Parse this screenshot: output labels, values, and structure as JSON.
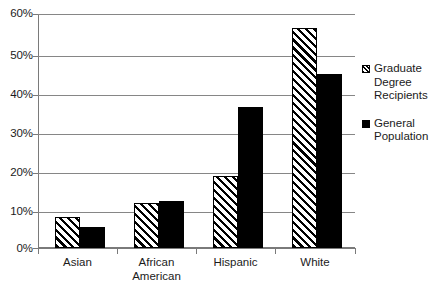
{
  "chart_data": {
    "type": "bar",
    "title": "",
    "subtitle": "",
    "xlabel": "",
    "ylabel": "",
    "categories": [
      "Asian",
      "African\nAmerican",
      "Hispanic",
      "White"
    ],
    "series": [
      {
        "name": "Graduate\nDegree\nRecipients",
        "legend_label": "Graduate\nDegree\nRecipients",
        "marker": "hatched-square",
        "fill": "diagonal-hatch",
        "color": "#000000",
        "values": [
          8.0,
          11.5,
          18.5,
          56.5
        ]
      },
      {
        "name": "General\nPopulation",
        "legend_label": "General\nPopulation",
        "marker": "solid-square",
        "fill": "solid",
        "color": "#000000",
        "values": [
          5.5,
          12.0,
          36.2,
          44.7
        ]
      }
    ],
    "ylim": [
      0,
      60
    ],
    "y_ticks": [
      0,
      10,
      20,
      30,
      40,
      50,
      60
    ],
    "y_tick_labels": [
      "0%",
      "10%",
      "20%",
      "30%",
      "40%",
      "50%",
      "60%"
    ],
    "grid": true,
    "grid_axis": "y",
    "legend_position": "right",
    "value_suffix": "%"
  },
  "axis": {
    "y_labels": [
      "60%",
      "50%",
      "40%",
      "30%",
      "20%",
      "10%",
      "0%"
    ],
    "x_labels": [
      "Asian",
      "African\nAmerican",
      "Hispanic",
      "White"
    ]
  },
  "legend": {
    "entries": [
      {
        "label": "Graduate\nDegree\nRecipients"
      },
      {
        "label": "General\nPopulation"
      }
    ]
  },
  "colors": {
    "background": "#ffffff",
    "axis": "#7a7a7a",
    "gridline": "#868686",
    "text": "#1b1b1b",
    "bar": "#000000"
  }
}
